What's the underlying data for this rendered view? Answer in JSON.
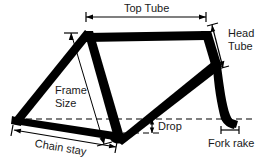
{
  "diagram": {
    "background_color": "#ffffff",
    "line_color": "#000000",
    "text_color": "#1a1a1a",
    "labels": {
      "top_tube": "Top Tube",
      "head_tube_line1": "Head",
      "head_tube_line2": "Tube",
      "frame_size_line1": "Frame",
      "frame_size_line2": "Size",
      "drop": "Drop",
      "fork_rake": "Fork rake",
      "chain_stay": "Chain stay"
    },
    "geometry": {
      "rear_dropout": [
        16,
        120
      ],
      "bottom_bracket": [
        119,
        137
      ],
      "seat_tube_top": [
        88,
        32
      ],
      "top_tube_front": [
        206,
        33
      ],
      "head_tube_bottom": [
        216,
        66
      ],
      "fork_dropout": [
        227,
        123
      ],
      "axle_line_y": 119,
      "bb_line_y": 133
    },
    "dimensions": [
      {
        "name": "top-tube",
        "label": "Top Tube",
        "orientation": "horizontal",
        "x1": 86,
        "x2": 206,
        "y": 17
      },
      {
        "name": "head-tube",
        "label": "Head Tube",
        "orientation": "diagonal",
        "x1": 211,
        "y1": 24,
        "x2": 222,
        "y2": 67
      },
      {
        "name": "frame-size",
        "label": "Frame Size",
        "orientation": "diagonal",
        "x1": 71,
        "y1": 33,
        "x2": 104,
        "y2": 144
      },
      {
        "name": "drop",
        "label": "Drop",
        "orientation": "vertical",
        "x": 152,
        "y1": 119,
        "y2": 133
      },
      {
        "name": "fork-rake",
        "label": "Fork rake",
        "orientation": "horizontal",
        "x1": 221,
        "x2": 239,
        "y": 130
      },
      {
        "name": "chain-stay",
        "label": "Chain stay",
        "orientation": "horizontal",
        "x1": 14,
        "x2": 115,
        "y": 132
      }
    ]
  }
}
